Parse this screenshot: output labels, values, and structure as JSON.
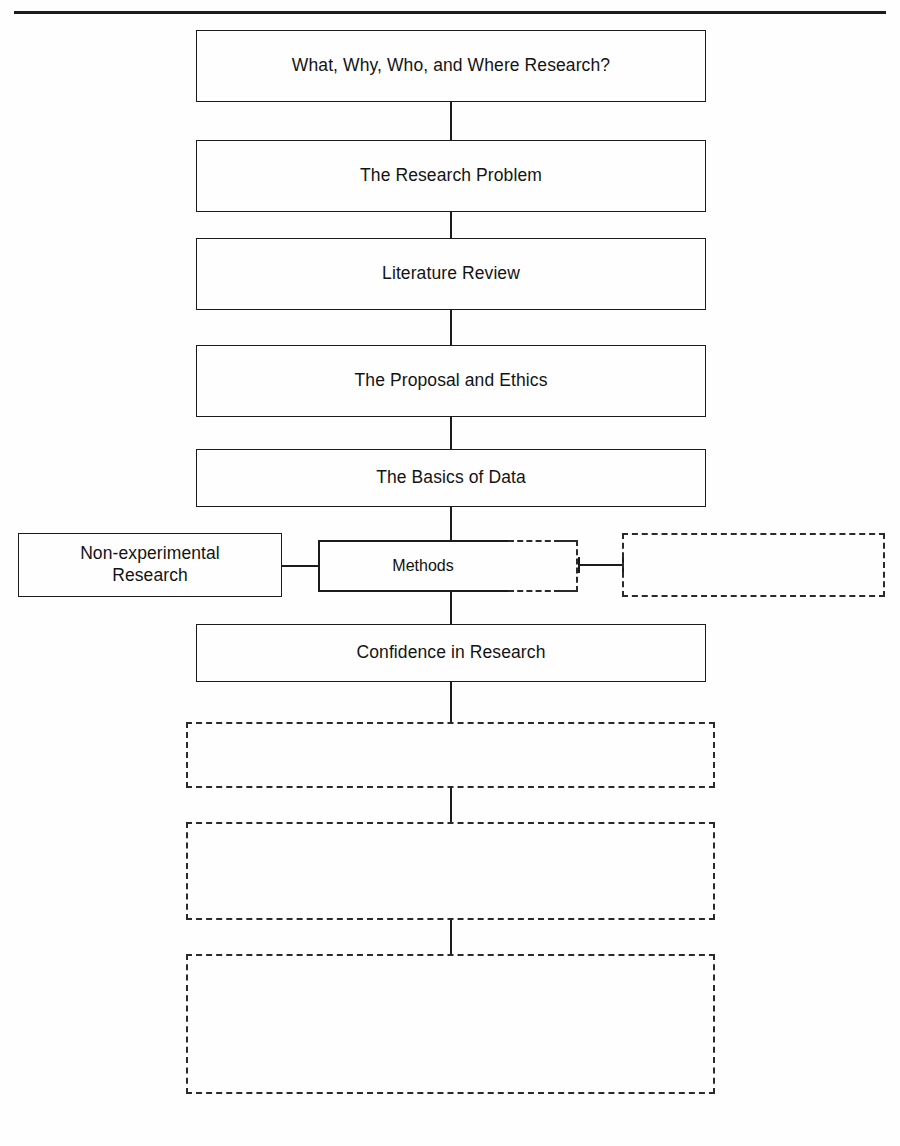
{
  "diagram": {
    "top_rule": true,
    "nodes": [
      {
        "id": "n1",
        "label": "What, Why, Who, and Where Research?",
        "style": "solid",
        "x": 196,
        "y": 30,
        "w": 510,
        "h": 72
      },
      {
        "id": "n2",
        "label": "The Research Problem",
        "style": "solid",
        "x": 196,
        "y": 140,
        "w": 510,
        "h": 72
      },
      {
        "id": "n3",
        "label": "Literature Review",
        "style": "solid",
        "x": 196,
        "y": 238,
        "w": 510,
        "h": 72
      },
      {
        "id": "n4",
        "label": "The Proposal and Ethics",
        "style": "solid",
        "x": 196,
        "y": 345,
        "w": 510,
        "h": 72
      },
      {
        "id": "n5",
        "label": "The Basics of Data",
        "style": "solid",
        "x": 196,
        "y": 449,
        "w": 510,
        "h": 58
      },
      {
        "id": "n6",
        "label": "Non-experimental\nResearch",
        "style": "solid",
        "x": 18,
        "y": 533,
        "w": 264,
        "h": 64
      },
      {
        "id": "n7",
        "label": "Methods",
        "style": "composite",
        "x": 318,
        "y": 540,
        "w": 260,
        "h": 52
      },
      {
        "id": "n8",
        "label": "",
        "style": "dashed",
        "x": 622,
        "y": 533,
        "w": 263,
        "h": 64
      },
      {
        "id": "n9",
        "label": "Confidence in Research",
        "style": "solid",
        "x": 196,
        "y": 624,
        "w": 510,
        "h": 58
      },
      {
        "id": "n10",
        "label": "",
        "style": "dashed",
        "x": 186,
        "y": 722,
        "w": 529,
        "h": 66
      },
      {
        "id": "n11",
        "label": "",
        "style": "dashed",
        "x": 186,
        "y": 822,
        "w": 529,
        "h": 98
      },
      {
        "id": "n12",
        "label": "",
        "style": "dashed",
        "x": 186,
        "y": 954,
        "w": 529,
        "h": 140
      }
    ],
    "connectors": [
      {
        "id": "c1",
        "from": "n1",
        "to": "n2",
        "orientation": "vertical",
        "x": 450,
        "y": 102,
        "length": 38
      },
      {
        "id": "c2",
        "from": "n2",
        "to": "n3",
        "orientation": "vertical",
        "x": 450,
        "y": 212,
        "length": 26
      },
      {
        "id": "c3",
        "from": "n3",
        "to": "n4",
        "orientation": "vertical",
        "x": 450,
        "y": 310,
        "length": 35
      },
      {
        "id": "c4",
        "from": "n4",
        "to": "n5",
        "orientation": "vertical",
        "x": 450,
        "y": 417,
        "length": 32
      },
      {
        "id": "c5",
        "from": "n5",
        "to": "n7",
        "orientation": "vertical",
        "x": 450,
        "y": 507,
        "length": 35
      },
      {
        "id": "c6",
        "from": "n6",
        "to": "n7",
        "orientation": "horizontal",
        "x": 282,
        "y": 565,
        "length": 36
      },
      {
        "id": "c7",
        "from": "n7",
        "to": "n8",
        "orientation": "horizontal",
        "x": 578,
        "y": 565,
        "length": 46
      },
      {
        "id": "c8",
        "from": "n7",
        "to": "n9",
        "orientation": "vertical",
        "x": 450,
        "y": 592,
        "length": 32
      },
      {
        "id": "c9",
        "from": "n9",
        "to": "n10",
        "orientation": "vertical",
        "x": 450,
        "y": 682,
        "length": 42
      },
      {
        "id": "c10",
        "from": "n10",
        "to": "n11",
        "orientation": "vertical",
        "x": 450,
        "y": 788,
        "length": 36
      },
      {
        "id": "c11",
        "from": "n11",
        "to": "n12",
        "orientation": "vertical",
        "x": 450,
        "y": 920,
        "length": 36
      }
    ]
  }
}
